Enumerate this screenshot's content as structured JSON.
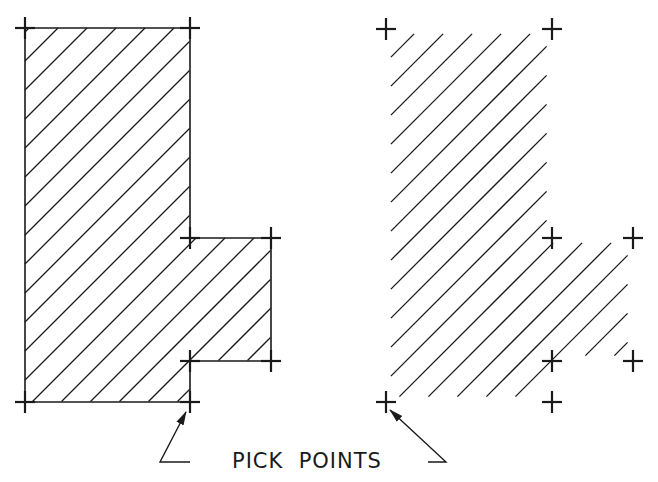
{
  "colors": {
    "background": "#ffffff",
    "ink": "#1a1a1a"
  },
  "caption": {
    "text": "PICK  POINTS",
    "x": 232,
    "y": 449
  },
  "hatch": {
    "angle_deg": 45,
    "spacing": 29,
    "offset": 4
  },
  "figures": [
    {
      "name": "hatched-region-with-boundary",
      "show_boundary": true,
      "polygon": [
        [
          25,
          28
        ],
        [
          190,
          28
        ],
        [
          190,
          238
        ],
        [
          271,
          238
        ],
        [
          271,
          361
        ],
        [
          190,
          361
        ],
        [
          190,
          402
        ],
        [
          25,
          402
        ]
      ],
      "pick_points": [
        [
          25,
          28
        ],
        [
          190,
          28
        ],
        [
          190,
          238
        ],
        [
          271,
          238
        ],
        [
          190,
          361
        ],
        [
          271,
          361
        ],
        [
          25,
          402
        ],
        [
          190,
          402
        ]
      ],
      "leader": {
        "tip": [
          186,
          412
        ],
        "elbow": [
          160,
          462
        ],
        "end": [
          190,
          462
        ]
      }
    },
    {
      "name": "hatched-region-without-boundary",
      "show_boundary": false,
      "polygon": [
        [
          386,
          29
        ],
        [
          552,
          29
        ],
        [
          552,
          238
        ],
        [
          633,
          238
        ],
        [
          633,
          361
        ],
        [
          552,
          361
        ],
        [
          552,
          402
        ],
        [
          386,
          402
        ]
      ],
      "pick_points": [
        [
          386,
          29
        ],
        [
          552,
          29
        ],
        [
          552,
          238
        ],
        [
          633,
          238
        ],
        [
          552,
          361
        ],
        [
          633,
          361
        ],
        [
          386,
          402
        ],
        [
          552,
          402
        ]
      ],
      "leader": {
        "tip": [
          390,
          410
        ],
        "elbow": [
          446,
          462
        ],
        "end": [
          428,
          462
        ]
      }
    }
  ]
}
